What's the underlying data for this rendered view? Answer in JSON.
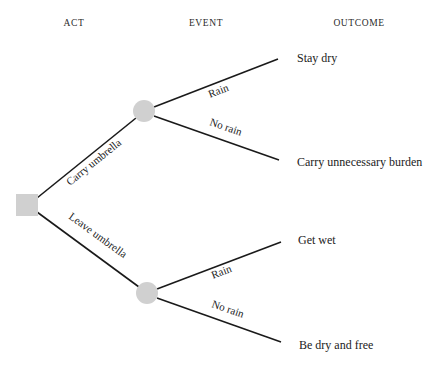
{
  "headers": {
    "act": "ACT",
    "event": "EVENT",
    "outcome": "OUTCOME"
  },
  "colors": {
    "line": "#1a1a1a",
    "node_fill": "#d0d0d0",
    "text": "#222222"
  },
  "decision_node": {
    "shape": "square",
    "label": ""
  },
  "acts": [
    {
      "label": "Carry umbrella",
      "chance_node": {
        "shape": "circle"
      },
      "events": [
        {
          "label": "Rain",
          "outcome": "Stay dry"
        },
        {
          "label": "No rain",
          "outcome": "Carry unnecessary burden"
        }
      ]
    },
    {
      "label": "Leave umbrella",
      "chance_node": {
        "shape": "circle"
      },
      "events": [
        {
          "label": "Rain",
          "outcome": "Get wet"
        },
        {
          "label": "No rain",
          "outcome": "Be dry and free"
        }
      ]
    }
  ]
}
